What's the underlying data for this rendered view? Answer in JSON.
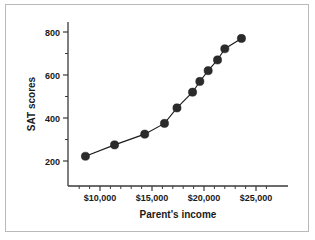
{
  "chart_data": {
    "type": "line",
    "title": "",
    "xlabel": "Parent's income",
    "ylabel": "SAT scores",
    "xlim": [
      6500,
      27000
    ],
    "ylim": [
      150,
      840
    ],
    "grid": false,
    "legend": "none",
    "marker": "filled-circle",
    "x": [
      8600,
      11400,
      14300,
      16200,
      17400,
      18900,
      19600,
      20400,
      21300,
      22000,
      23600
    ],
    "values": [
      222,
      275,
      325,
      375,
      447,
      520,
      570,
      620,
      670,
      722,
      770
    ],
    "points": [
      {
        "income": 8600,
        "sat": 222
      },
      {
        "income": 11400,
        "sat": 275
      },
      {
        "income": 14300,
        "sat": 325
      },
      {
        "income": 16200,
        "sat": 375
      },
      {
        "income": 17400,
        "sat": 447
      },
      {
        "income": 18900,
        "sat": 520
      },
      {
        "income": 19600,
        "sat": 570
      },
      {
        "income": 20400,
        "sat": 620
      },
      {
        "income": 21300,
        "sat": 670
      },
      {
        "income": 22000,
        "sat": 722
      },
      {
        "income": 23600,
        "sat": 770
      }
    ],
    "x_tick_labels": [
      "$10,000",
      "$15,000",
      "$20,000",
      "$25,000"
    ],
    "x_tick_values": [
      10000,
      15000,
      20000,
      25000
    ],
    "x_minor_tick_values": [
      8000,
      9000,
      11000,
      12000,
      13000,
      14000,
      16000,
      17000,
      18000,
      19000,
      21000,
      22000,
      23000,
      24000,
      26000
    ],
    "y_tick_labels": [
      "800",
      "600",
      "400",
      "200"
    ],
    "y_tick_values": [
      800,
      600,
      400,
      200
    ],
    "y_minor_tick_values": [
      700,
      500,
      300
    ],
    "colors": {
      "marker": "#2b2b2b",
      "line": "#1a1a1a",
      "axis": "#3a3a3a",
      "text": "#1a1a1a",
      "frame": "#b9b9b9",
      "background": "#ffffff"
    }
  }
}
